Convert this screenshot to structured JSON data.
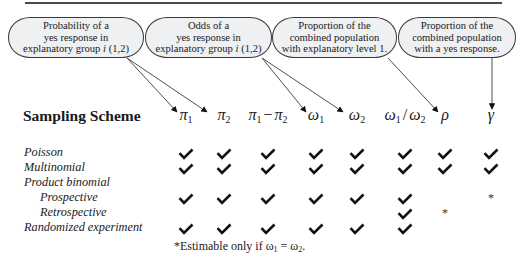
{
  "callouts": [
    {
      "id": "prob",
      "lines": [
        "Probability of a",
        "yes response in",
        "explanatory group "
      ],
      "suffix_italic": "i",
      "suffix": " (1,2)",
      "left": 8,
      "width": 136
    },
    {
      "id": "odds",
      "lines": [
        "Odds of a",
        "yes response in",
        "explanatory group "
      ],
      "suffix_italic": "i",
      "suffix": " (1,2)",
      "left": 145,
      "width": 127
    },
    {
      "id": "rho",
      "lines": [
        "Proportion of the",
        "combined population",
        "with explanatory level 1."
      ],
      "left": 272,
      "width": 125
    },
    {
      "id": "gamma",
      "lines": [
        "Proportion of the",
        "combined population",
        "with a yes response."
      ],
      "left": 398,
      "width": 118
    }
  ],
  "table": {
    "heading": "Sampling Scheme",
    "columns": [
      {
        "sym": "π",
        "sub": "1",
        "x": 186
      },
      {
        "sym": "π",
        "sub": "2",
        "x": 224
      },
      {
        "sym": "π",
        "sub": "1",
        "op": "−",
        "sym2": "π",
        "sub2": "2",
        "x": 268
      },
      {
        "sym": "ω",
        "sub": "1",
        "x": 316
      },
      {
        "sym": "ω",
        "sub": "2",
        "x": 357
      },
      {
        "sym": "ω",
        "sub": "1",
        "op": "/",
        "sym2": "ω",
        "sub2": "2",
        "x": 405
      },
      {
        "sym": "ρ",
        "x": 445
      },
      {
        "sym": "γ",
        "x": 491
      }
    ],
    "rows": [
      {
        "label": "Poisson",
        "indent": false,
        "top": 145,
        "cells": [
          "check",
          "check",
          "check",
          "check",
          "check",
          "check",
          "check",
          "check"
        ]
      },
      {
        "label": "Multinomial",
        "indent": false,
        "top": 160,
        "cells": [
          "check",
          "check",
          "check",
          "check",
          "check",
          "check",
          "check",
          "check"
        ]
      },
      {
        "label": "Product binomial",
        "indent": false,
        "top": 175,
        "cells": [
          "",
          "",
          "",
          "",
          "",
          "",
          "",
          ""
        ]
      },
      {
        "label": "Prospective",
        "indent": true,
        "top": 190,
        "cells": [
          "check",
          "check",
          "check",
          "check",
          "check",
          "check",
          "",
          "star"
        ]
      },
      {
        "label": "Retrospective",
        "indent": true,
        "top": 205,
        "cells": [
          "",
          "",
          "",
          "",
          "",
          "check",
          "star",
          ""
        ]
      },
      {
        "label": "Randomized experiment",
        "indent": false,
        "top": 220,
        "cells": [
          "check",
          "check",
          "check",
          "check",
          "check",
          "check",
          "",
          ""
        ]
      }
    ]
  },
  "footnote": {
    "prefix": "*Estimable only if ω",
    "sub1": "1",
    "mid": " = ω",
    "sub2": "2",
    "end": "."
  },
  "arrows": [
    {
      "from": [
        127,
        58
      ],
      "to": [
        177,
        112
      ]
    },
    {
      "from": [
        127,
        58
      ],
      "to": [
        207,
        112
      ]
    },
    {
      "from": [
        262,
        58
      ],
      "to": [
        306,
        112
      ]
    },
    {
      "from": [
        262,
        58
      ],
      "to": [
        343,
        112
      ]
    },
    {
      "from": [
        388,
        58
      ],
      "to": [
        438,
        112
      ]
    },
    {
      "from": [
        492,
        58
      ],
      "to": [
        492,
        109
      ]
    }
  ],
  "colors": {
    "ink": "#1a1a1a",
    "callout_fill": "#eef0f2",
    "line": "#3a3a3a"
  }
}
